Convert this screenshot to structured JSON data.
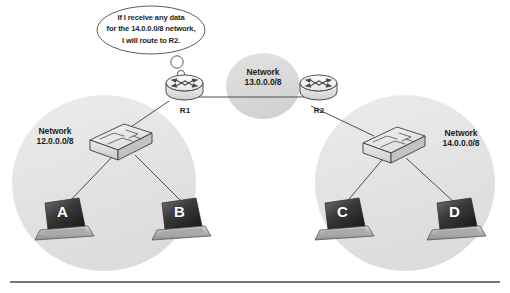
{
  "diagram": {
    "callout": {
      "lines": [
        "If I receive any data",
        "for the 14.0.0.0/8 network,",
        "I will route to R2."
      ],
      "speaker": "R1"
    },
    "zones": [
      {
        "id": "left",
        "label_line1": "Network",
        "label_line2": "12.0.0.0/8",
        "fill": "#e4e4e4"
      },
      {
        "id": "middle",
        "label_line1": "Network",
        "label_line2": "13.0.0.0/8",
        "fill": "#dcdcdc"
      },
      {
        "id": "right",
        "label_line1": "Network",
        "label_line2": "14.0.0.0/8",
        "fill": "#e4e4e4"
      }
    ],
    "routers": [
      {
        "id": "r1",
        "label": "R1"
      },
      {
        "id": "r2",
        "label": "R2"
      }
    ],
    "switches": [
      {
        "id": "sw-left",
        "zone": "12.0.0.0/8"
      },
      {
        "id": "sw-right",
        "zone": "14.0.0.0/8"
      }
    ],
    "hosts": [
      {
        "id": "a",
        "label": "A",
        "zone": "12.0.0.0/8"
      },
      {
        "id": "b",
        "label": "B",
        "zone": "12.0.0.0/8"
      },
      {
        "id": "c",
        "label": "C",
        "zone": "14.0.0.0/8"
      },
      {
        "id": "d",
        "label": "D",
        "zone": "14.0.0.0/8"
      }
    ],
    "colors": {
      "zone_fill": "#e4e4e4",
      "middle_fill": "#dcdcdc",
      "line": "#3c3c3c",
      "text": "#231f20",
      "rule": "#4a4a4a"
    }
  }
}
